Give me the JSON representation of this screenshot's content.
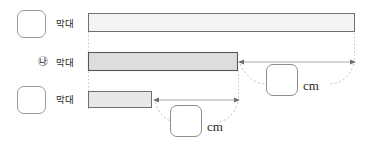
{
  "figure": {
    "kind": "bar-length-comparison-worksheet",
    "background": "#ffffff"
  },
  "rows": [
    {
      "id": "row-top",
      "marker": {
        "type": "empty-box",
        "text": ""
      },
      "label": "막대",
      "bar": {
        "name": "bar-top",
        "x": 88,
        "y": 13,
        "width": 267,
        "height": 19,
        "fill": "#f2f2f2",
        "stroke": "#6e6e6e"
      }
    },
    {
      "id": "row-middle",
      "marker": {
        "type": "circled-letter",
        "text": "㉯"
      },
      "label": "막대",
      "bar": {
        "name": "bar-middle",
        "x": 88,
        "y": 52,
        "width": 150,
        "height": 19,
        "fill": "#dcdcdc",
        "stroke": "#5a5a5a"
      }
    },
    {
      "id": "row-bottom",
      "marker": {
        "type": "empty-box",
        "text": ""
      },
      "label": "막대",
      "bar": {
        "name": "bar-bottom",
        "x": 88,
        "y": 91,
        "width": 64,
        "height": 17,
        "fill": "#e6e6e6",
        "stroke": "#6e6e6e"
      }
    }
  ],
  "measurements": [
    {
      "id": "measure-upper",
      "description": "difference between top bar and middle bar",
      "arrow": {
        "x1": 240,
        "y1": 62,
        "x2": 356,
        "y2": 62
      },
      "answer_value": "",
      "unit": "cm"
    },
    {
      "id": "measure-lower",
      "description": "difference between middle bar and bottom bar",
      "arrow": {
        "x1": 154,
        "y1": 100,
        "x2": 239,
        "y2": 100
      },
      "answer_value": "",
      "unit": "cm"
    }
  ],
  "guides": {
    "left_x": 88,
    "right_x": 355,
    "color": "#bdbdbd",
    "style": "dotted"
  },
  "colors": {
    "bar_light": "#f2f2f2",
    "bar_medium": "#dcdcdc",
    "bar_pale": "#e6e6e6",
    "outline": "#6e6e6e",
    "guide": "#bdbdbd",
    "arrow": "#9b9b9b",
    "text": "#2b2b2b"
  }
}
